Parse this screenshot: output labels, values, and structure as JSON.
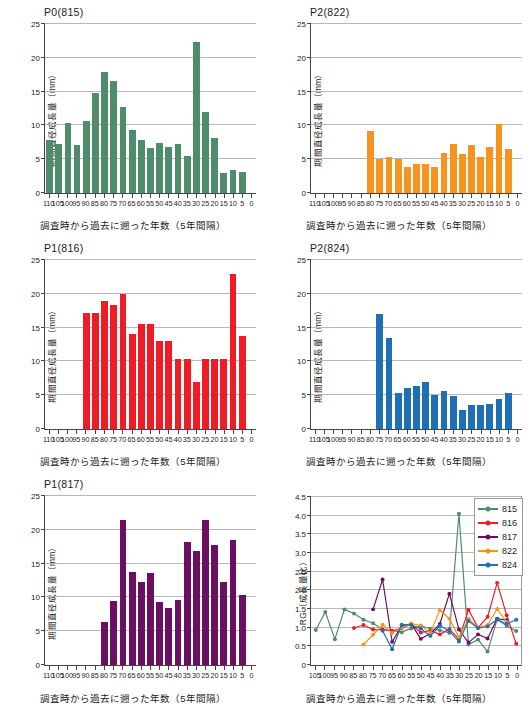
{
  "figure": {
    "axis_label_x": "調査時から過去に遡った年数（5年間隔）",
    "axis_label_y_growth": "期間直径成長量（mm）",
    "axis_label_y_rg": "RG（成長量比）"
  },
  "colors": {
    "green": "#4e8c6b",
    "red": "#ee1c25",
    "purple": "#6b1060",
    "orange": "#f7941e",
    "blue": "#1f6fb5",
    "gridline": "#b8b8b8",
    "axis": "#444444"
  },
  "chart_data": [
    {
      "id": "p0-815",
      "type": "bar",
      "title": "P0(815)",
      "xlabel": "調査時から過去に遡った年数（5年間隔）",
      "ylabel": "期間直径成長量（mm）",
      "ylim": [
        0,
        25
      ],
      "yticks": [
        0,
        5,
        10,
        15,
        20,
        25
      ],
      "grid": true,
      "color": "#4e8c6b",
      "categories": [
        110,
        105,
        100,
        95,
        90,
        85,
        80,
        75,
        70,
        65,
        60,
        55,
        50,
        45,
        40,
        35,
        30,
        25,
        20,
        15,
        10,
        5,
        0
      ],
      "values": [
        7.8,
        7.2,
        10.4,
        7.1,
        10.6,
        14.8,
        17.9,
        16.6,
        12.7,
        9.3,
        7.8,
        6.6,
        7.4,
        6.8,
        7.2,
        5.5,
        22.3,
        12.0,
        8.1,
        2.9,
        3.4,
        3.1,
        0
      ]
    },
    {
      "id": "p2-822",
      "type": "bar",
      "title": "P2(822)",
      "xlabel": "調査時から過去に遡った年数（5年間隔）",
      "ylabel": "期間直径成長量（mm）",
      "ylim": [
        0,
        25
      ],
      "yticks": [
        0,
        5,
        10,
        15,
        20,
        25
      ],
      "grid": true,
      "color": "#f7941e",
      "categories": [
        110,
        105,
        100,
        95,
        90,
        85,
        80,
        75,
        70,
        65,
        60,
        55,
        50,
        45,
        40,
        35,
        30,
        25,
        20,
        15,
        10,
        5,
        0
      ],
      "values": [
        0,
        0,
        0,
        0,
        0,
        0,
        9.1,
        5.0,
        5.3,
        5.0,
        3.8,
        4.3,
        4.3,
        3.9,
        5.9,
        7.3,
        5.7,
        7.1,
        5.3,
        6.8,
        10.2,
        6.5,
        0
      ]
    },
    {
      "id": "p1-816",
      "type": "bar",
      "title": "P1(816)",
      "xlabel": "調査時から過去に遡った年数（5年間隔）",
      "ylabel": "期間直径成長量（mm）",
      "ylim": [
        0,
        25
      ],
      "yticks": [
        0,
        5,
        10,
        15,
        20,
        25
      ],
      "grid": true,
      "color": "#ee1c25",
      "categories": [
        110,
        105,
        100,
        95,
        90,
        85,
        80,
        75,
        70,
        65,
        60,
        55,
        50,
        45,
        40,
        35,
        30,
        25,
        20,
        15,
        10,
        5,
        0
      ],
      "values": [
        0,
        0,
        0,
        0,
        17.2,
        17.2,
        19.0,
        18.3,
        20.0,
        14.0,
        15.5,
        15.5,
        13.0,
        13.0,
        10.4,
        10.4,
        7.0,
        10.4,
        10.4,
        10.4,
        23.0,
        13.8,
        0
      ]
    },
    {
      "id": "p2-824",
      "type": "bar",
      "title": "P2(824)",
      "xlabel": "調査時から過去に遡った年数（5年間隔）",
      "ylabel": "期間直径成長量（mm）",
      "ylim": [
        0,
        25
      ],
      "yticks": [
        0,
        5,
        10,
        15,
        20,
        25
      ],
      "grid": true,
      "color": "#1f6fb5",
      "categories": [
        110,
        105,
        100,
        95,
        90,
        85,
        80,
        75,
        70,
        65,
        60,
        55,
        50,
        45,
        40,
        35,
        30,
        25,
        20,
        15,
        10,
        5,
        0
      ],
      "values": [
        0,
        0,
        0,
        0,
        0,
        0,
        0,
        17.0,
        13.4,
        5.4,
        6.0,
        6.4,
        6.9,
        5.1,
        5.6,
        4.9,
        2.8,
        3.6,
        3.6,
        3.7,
        4.5,
        5.4,
        0
      ]
    },
    {
      "id": "p1-817",
      "type": "bar",
      "title": "P1(817)",
      "xlabel": "調査時から過去に遡った年数（5年間隔）",
      "ylabel": "期間直径成長量（mm）",
      "ylim": [
        0,
        25
      ],
      "yticks": [
        0,
        5,
        10,
        15,
        20,
        25
      ],
      "grid": true,
      "color": "#6b1060",
      "categories": [
        110,
        105,
        100,
        95,
        90,
        85,
        80,
        75,
        70,
        65,
        60,
        55,
        50,
        45,
        40,
        35,
        30,
        25,
        20,
        15,
        10,
        5,
        0
      ],
      "values": [
        0,
        0,
        0,
        0,
        0,
        0,
        6.3,
        9.4,
        21.5,
        13.7,
        12.3,
        13.6,
        9.3,
        8.4,
        9.6,
        18.2,
        16.9,
        21.4,
        17.8,
        12.3,
        18.5,
        10.3,
        0
      ]
    },
    {
      "id": "rg-ratio",
      "type": "line",
      "title": "",
      "xlabel": "調査時から過去に遡った年数（5年間隔）",
      "ylabel": "RG（成長量比）",
      "ylim": [
        0,
        4.5
      ],
      "yticks": [
        0,
        0.5,
        1.0,
        1.5,
        2.0,
        2.5,
        3.0,
        3.5,
        4.0,
        4.5
      ],
      "ytick_labels": [
        "0",
        "0.5",
        "1.0",
        "1.5",
        "2.0",
        "2.5",
        "3.0",
        "3.5",
        "4.0",
        "4.5"
      ],
      "grid": true,
      "legend_position": "top-right",
      "x": [
        105,
        100,
        95,
        90,
        85,
        80,
        75,
        70,
        65,
        60,
        55,
        50,
        45,
        40,
        35,
        30,
        25,
        20,
        15,
        10,
        5,
        0
      ],
      "series": [
        {
          "name": "815",
          "color": "#4e8c6b",
          "values": [
            0.94,
            1.42,
            0.69,
            1.49,
            1.38,
            1.21,
            1.12,
            0.95,
            0.92,
            0.88,
            0.98,
            1.05,
            0.97,
            0.93,
            0.86,
            4.05,
            0.55,
            0.68,
            0.36,
            1.22,
            1.05,
            0.91
          ]
        },
        {
          "name": "816",
          "color": "#ee1c25",
          "values": [
            null,
            null,
            null,
            null,
            0.99,
            1.07,
            0.95,
            0.95,
            0.91,
            0.99,
            1.09,
            0.87,
            0.92,
            0.82,
            0.96,
            0.7,
            1.48,
            1.0,
            1.29,
            2.2,
            1.33,
            0.57
          ]
        },
        {
          "name": "817",
          "color": "#6b1060",
          "values": [
            null,
            null,
            null,
            null,
            null,
            null,
            1.49,
            2.29,
            0.62,
            1.05,
            1.1,
            0.7,
            0.84,
            1.1,
            1.91,
            0.95,
            0.6,
            0.82,
            0.71,
            1.24,
            1.2,
            null
          ]
        },
        {
          "name": "822",
          "color": "#f7941e",
          "values": [
            null,
            null,
            null,
            null,
            null,
            0.55,
            0.81,
            1.08,
            0.86,
            0.99,
            1.11,
            1.06,
            0.86,
            1.47,
            1.24,
            0.74,
            1.24,
            1.0,
            1.07,
            1.5,
            1.15,
            null
          ]
        },
        {
          "name": "824",
          "color": "#1f6fb5",
          "values": [
            null,
            null,
            null,
            null,
            null,
            null,
            null,
            0.92,
            0.42,
            1.08,
            1.07,
            0.98,
            0.78,
            1.05,
            0.91,
            0.63,
            1.18,
            0.99,
            1.03,
            1.22,
            1.1,
            1.21
          ]
        }
      ]
    }
  ]
}
